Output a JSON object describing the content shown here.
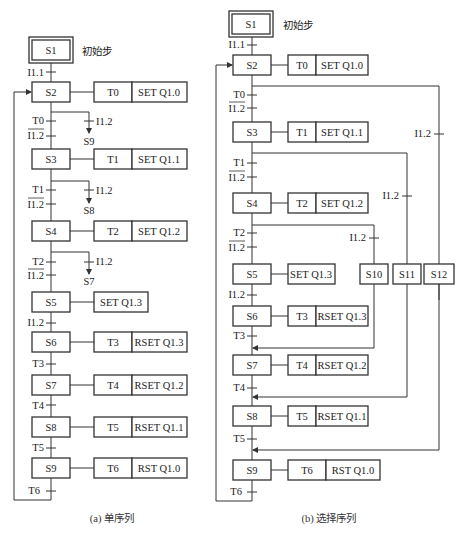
{
  "diagram_a": {
    "caption": "(a) 单序列",
    "initial_step": "S1",
    "initial_label": "初始步",
    "steps": [
      "S2",
      "S3",
      "S4",
      "S5",
      "S6",
      "S7",
      "S8",
      "S9"
    ],
    "actions": [
      {
        "timer": "T0",
        "op": "SET  Q1.0"
      },
      {
        "timer": "T1",
        "op": "SET  Q1.1"
      },
      {
        "timer": "T2",
        "op": "SET  Q1.2"
      },
      {
        "timer": "",
        "op": "SET  Q1.3"
      },
      {
        "timer": "T3",
        "op": "RSET Q1.3"
      },
      {
        "timer": "T4",
        "op": "RSET Q1.2"
      },
      {
        "timer": "T5",
        "op": "RSET Q1.1"
      },
      {
        "timer": "T6",
        "op": "RST   Q1.0"
      }
    ],
    "transitions": {
      "t_i11": "I1.1",
      "t0": "T0",
      "n0": "I1.2",
      "t1": "T1",
      "n1": "I1.2",
      "t2": "T2",
      "n2": "I1.2",
      "t_i12": "I1.2",
      "t3": "T3",
      "t4": "T4",
      "t5": "T5",
      "t6": "T6"
    },
    "jumps": [
      {
        "cond": "I1.2",
        "target": "S9"
      },
      {
        "cond": "I1.2",
        "target": "S8"
      },
      {
        "cond": "I1.2",
        "target": "S7"
      }
    ]
  },
  "diagram_b": {
    "caption": "(b) 选择序列",
    "initial_step": "S1",
    "initial_label": "初始步",
    "steps": [
      "S2",
      "S3",
      "S4",
      "S5",
      "S6",
      "S7",
      "S8",
      "S9"
    ],
    "branch_steps": [
      "S10",
      "S11",
      "S12"
    ],
    "actions": [
      {
        "timer": "T0",
        "op": "SET  Q1.0"
      },
      {
        "timer": "T1",
        "op": "SET  Q1.1"
      },
      {
        "timer": "T2",
        "op": "SET  Q1.2"
      },
      {
        "timer": "",
        "op": "SET Q1.3"
      },
      {
        "timer": "T3",
        "op": "RSET Q1.3"
      },
      {
        "timer": "T4",
        "op": "RSET Q1.2"
      },
      {
        "timer": "T5",
        "op": "RSET Q1.1"
      },
      {
        "timer": "T6",
        "op": "RST   Q1.0"
      }
    ],
    "transitions": {
      "t_i11": "I1.1",
      "t0": "T0",
      "n0": "I1.2",
      "t1": "T1",
      "n1": "I1.2",
      "t2": "T2",
      "n2": "I1.2",
      "t_i12": "I1.2",
      "t3": "T3",
      "t4": "T4",
      "t5": "T5",
      "t6": "T6",
      "b10": "I1.2",
      "b11": "I1.2",
      "b12": "I1.2"
    }
  }
}
